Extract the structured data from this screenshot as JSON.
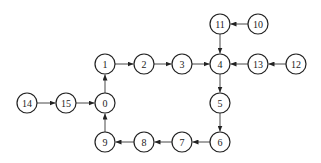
{
  "diagram": {
    "type": "directed-graph",
    "node_radius": 10,
    "stroke_color": "#222222",
    "nodes": [
      {
        "id": "0",
        "label": "0",
        "x": 105,
        "y": 103
      },
      {
        "id": "1",
        "label": "1",
        "x": 105,
        "y": 64
      },
      {
        "id": "2",
        "label": "2",
        "x": 144,
        "y": 64
      },
      {
        "id": "3",
        "label": "3",
        "x": 182,
        "y": 64
      },
      {
        "id": "4",
        "label": "4",
        "x": 220,
        "y": 64
      },
      {
        "id": "5",
        "label": "5",
        "x": 220,
        "y": 103
      },
      {
        "id": "6",
        "label": "6",
        "x": 220,
        "y": 142
      },
      {
        "id": "7",
        "label": "7",
        "x": 182,
        "y": 142
      },
      {
        "id": "8",
        "label": "8",
        "x": 144,
        "y": 142
      },
      {
        "id": "9",
        "label": "9",
        "x": 105,
        "y": 142
      },
      {
        "id": "10",
        "label": "10",
        "x": 258,
        "y": 24
      },
      {
        "id": "11",
        "label": "11",
        "x": 220,
        "y": 24
      },
      {
        "id": "12",
        "label": "12",
        "x": 296,
        "y": 64
      },
      {
        "id": "13",
        "label": "13",
        "x": 258,
        "y": 64
      },
      {
        "id": "14",
        "label": "14",
        "x": 27,
        "y": 103
      },
      {
        "id": "15",
        "label": "15",
        "x": 66,
        "y": 103
      }
    ],
    "edges": [
      {
        "from": "0",
        "to": "1"
      },
      {
        "from": "1",
        "to": "2"
      },
      {
        "from": "2",
        "to": "3"
      },
      {
        "from": "3",
        "to": "4"
      },
      {
        "from": "10",
        "to": "11"
      },
      {
        "from": "11",
        "to": "4"
      },
      {
        "from": "12",
        "to": "13"
      },
      {
        "from": "13",
        "to": "4"
      },
      {
        "from": "4",
        "to": "5"
      },
      {
        "from": "5",
        "to": "6"
      },
      {
        "from": "6",
        "to": "7"
      },
      {
        "from": "7",
        "to": "8"
      },
      {
        "from": "8",
        "to": "9"
      },
      {
        "from": "9",
        "to": "0"
      },
      {
        "from": "14",
        "to": "15"
      },
      {
        "from": "15",
        "to": "0"
      }
    ]
  }
}
